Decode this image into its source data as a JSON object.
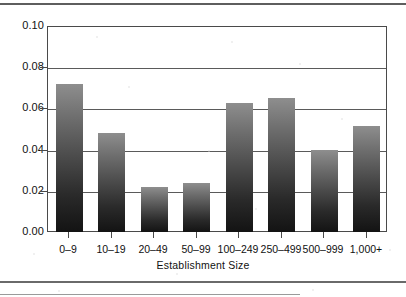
{
  "figure": {
    "kind": "scanned-figure",
    "background_color": "#ffffff",
    "rules": {
      "top_rule": "horizontal-rule",
      "bottom_rule": "horizontal-rule",
      "bottom_rule_short": "horizontal-rule-short"
    }
  },
  "chart_data": {
    "type": "bar",
    "title": "",
    "subtitle": "",
    "xlabel": "Establishment  Size",
    "ylabel": "",
    "categories": [
      "0–9",
      "10–19",
      "20–49",
      "50–99",
      "100–249",
      "250–499",
      "500–999",
      "1,000+"
    ],
    "values": [
      0.072,
      0.048,
      0.022,
      0.024,
      0.0625,
      0.065,
      0.04,
      0.0515
    ],
    "ylim": [
      0.0,
      0.1
    ],
    "ytick_labels": [
      "0.10",
      "0.08",
      "0.06",
      "0.04",
      "0.02",
      "0.00"
    ],
    "ytick_values": [
      0.1,
      0.08,
      0.06,
      0.04,
      0.02,
      0.0
    ],
    "grid": true,
    "grid_axis": "y",
    "legend": null,
    "legend_position": "none",
    "bar_fill": "vertical-gradient-gray-to-black",
    "bar_color_top": "#8e8e8e",
    "bar_color_bottom": "#131313",
    "axis_color": "#4a4a4a",
    "grid_color": "#5a5a5a",
    "text_color": "#111111"
  }
}
